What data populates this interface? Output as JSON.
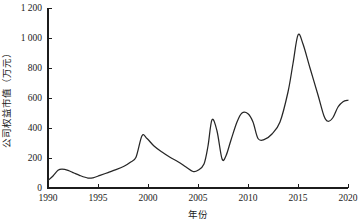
{
  "figure": {
    "background_color": "#ffffff",
    "line_color": "#262626",
    "axis_color": "#1c1c1c"
  },
  "chart_data": {
    "type": "line",
    "title": "",
    "subtitle": "",
    "xlabel": "年份",
    "ylabel": "公司权益市值（万元）",
    "xlim": [
      1990,
      2020
    ],
    "ylim": [
      0,
      1200
    ],
    "grid": false,
    "legend": null,
    "legend_position": "none",
    "xticks": [
      1990,
      1995,
      2000,
      2005,
      2010,
      2015,
      2020
    ],
    "xtick_labels": [
      "1990",
      "1995",
      "2000",
      "2005",
      "2010",
      "2015",
      "2020"
    ],
    "yticks": [
      0,
      200,
      400,
      600,
      800,
      1000,
      1200
    ],
    "ytick_labels": [
      "0",
      "200",
      "400",
      "600",
      "800",
      "1 000",
      "1 200"
    ],
    "series": [
      {
        "name": "公司权益市值",
        "x": [
          1990.0,
          1990.5,
          1991.0,
          1991.4,
          1992.0,
          1992.6,
          1993.2,
          1994.0,
          1994.5,
          1995.2,
          1996.0,
          1996.8,
          1997.6,
          1998.2,
          1998.8,
          1999.4,
          1999.9,
          2000.6,
          2001.4,
          2002.2,
          2003.0,
          2003.8,
          2004.5,
          2005.0,
          2005.6,
          2006.0,
          2006.4,
          2006.9,
          2007.4,
          2007.8,
          2008.3,
          2008.9,
          2009.4,
          2010.0,
          2010.5,
          2011.0,
          2011.6,
          2012.4,
          2013.2,
          2014.0,
          2014.5,
          2015.0,
          2015.5,
          2016.2,
          2017.0,
          2017.6,
          2018.0,
          2018.5,
          2019.0,
          2019.5,
          2020.0
        ],
        "y": [
          50,
          80,
          118,
          126,
          118,
          100,
          83,
          66,
          68,
          84,
          103,
          122,
          145,
          170,
          205,
          348,
          330,
          280,
          240,
          205,
          175,
          140,
          110,
          118,
          160,
          280,
          455,
          380,
          195,
          215,
          320,
          440,
          500,
          495,
          440,
          330,
          322,
          360,
          440,
          640,
          830,
          1020,
          960,
          800,
          620,
          480,
          445,
          470,
          540,
          575,
          585
        ]
      }
    ],
    "annotations": []
  }
}
